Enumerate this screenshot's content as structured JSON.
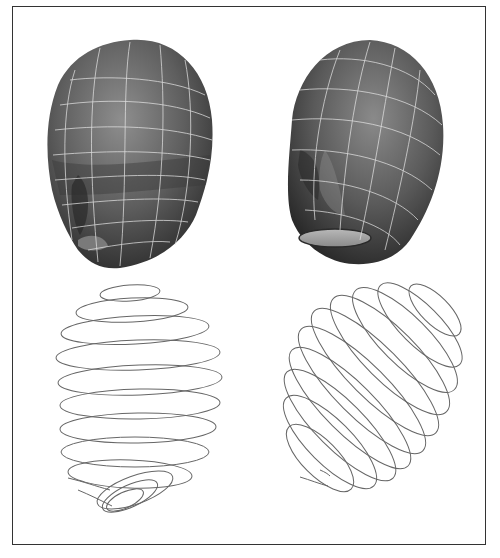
{
  "figure": {
    "panels": [
      {
        "id": "head-front",
        "kind": "shaded-mesh",
        "description": "Shaded 3D head model, front-left view, with white parametric grid lines"
      },
      {
        "id": "head-side",
        "kind": "shaded-mesh",
        "description": "Shaded 3D head model, three-quarter view, with white parametric grid lines and open neck"
      },
      {
        "id": "spiral-front",
        "kind": "curve",
        "description": "Single spiral curve tracing head surface, front view"
      },
      {
        "id": "spiral-side",
        "kind": "curve",
        "description": "Single spiral curve tracing head surface, tilted view"
      }
    ],
    "colors": {
      "frame": "#333333",
      "mesh_dark": "#2e2e2e",
      "mesh_mid": "#6a6a6a",
      "mesh_light": "#9a9a9a",
      "grid": "#e6e6e6",
      "curve": "#666666"
    }
  }
}
